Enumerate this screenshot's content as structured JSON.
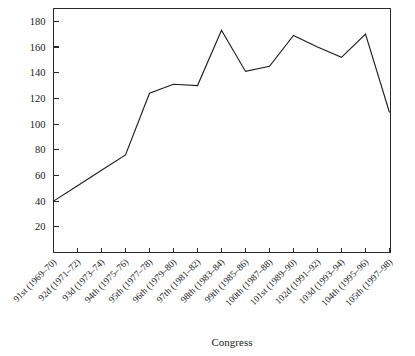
{
  "chart_data": {
    "type": "line",
    "title": "",
    "xlabel": "Congress",
    "ylabel": "",
    "categories": [
      "91st (1969–70)",
      "92d (1971–72)",
      "93d (1973–74)",
      "94th (1975–76)",
      "95th (1977–78)",
      "96th (1979–80)",
      "97th (1981–82)",
      "98th (1983–84)",
      "99th (1985–86)",
      "100th (1987–88)",
      "101st (1989–90)",
      "102d (1991–92)",
      "103d (1993–94)",
      "104th (1995–96)",
      "105th (1997–98)"
    ],
    "values": [
      40,
      52,
      64,
      76,
      124,
      131,
      130,
      173,
      141,
      145,
      169,
      160,
      152,
      170,
      109
    ],
    "ylim": [
      0,
      190
    ],
    "yticks": [
      20,
      40,
      60,
      80,
      100,
      120,
      140,
      160,
      180
    ],
    "ytick_labels": [
      "20",
      "40",
      "60",
      "80",
      "100",
      "120",
      "140",
      "160",
      "180"
    ],
    "grid": false,
    "legend": "none",
    "line_color": "#1f1f1f",
    "axis_color": "#2b2b2b",
    "background": "#ffffff",
    "frame": "box"
  }
}
